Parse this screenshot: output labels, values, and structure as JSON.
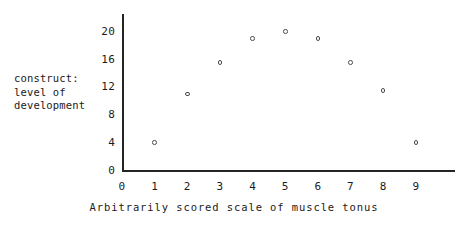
{
  "chart_data": {
    "type": "scatter",
    "title": "",
    "xlabel": "Arbitrarily scored scale of muscle tonus",
    "ylabel": "construct: level of development",
    "ylabel_lines": [
      "construct:",
      "level of",
      "development"
    ],
    "x": [
      1,
      2,
      3,
      4,
      5,
      6,
      7,
      8,
      9
    ],
    "values": [
      4,
      11,
      15.5,
      19,
      20,
      19,
      15.5,
      11.5,
      4
    ],
    "points": [
      {
        "x": 1,
        "y": 4
      },
      {
        "x": 2,
        "y": 11
      },
      {
        "x": 3,
        "y": 15.5
      },
      {
        "x": 4,
        "y": 19
      },
      {
        "x": 5,
        "y": 20
      },
      {
        "x": 6,
        "y": 19
      },
      {
        "x": 7,
        "y": 15.5
      },
      {
        "x": 8,
        "y": 11.5
      },
      {
        "x": 9,
        "y": 4
      }
    ],
    "xlim": [
      0,
      10.2
    ],
    "ylim": [
      0,
      22.5
    ],
    "xticks": [
      0,
      1,
      2,
      3,
      4,
      5,
      6,
      7,
      8,
      9
    ],
    "xtick_labels": [
      "0",
      "1",
      "2",
      "3",
      "4",
      "5",
      "6",
      "7",
      "8",
      "9"
    ],
    "yticks": [
      0,
      4,
      8,
      12,
      16,
      20
    ],
    "ytick_labels": [
      "0",
      "4",
      "8",
      "12",
      "16",
      "20"
    ],
    "grid": false,
    "legend": null,
    "marker": "open-circle",
    "marker_color": "#4a4a52",
    "axis_color": "#242424",
    "background_color": "#ffffff",
    "text_color": "#1b1b1b"
  }
}
